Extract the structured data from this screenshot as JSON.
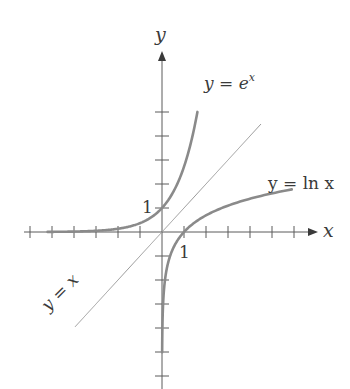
{
  "chart_data": {
    "type": "line",
    "title": "",
    "xlabel": "x",
    "ylabel": "y",
    "grid": false,
    "legend": "none (inline curve labels)",
    "origin_px": [
      162,
      232
    ],
    "scale_px_per_unit": {
      "x": 22,
      "y": 24
    },
    "x_ticks": [
      -6,
      -5,
      -4,
      -3,
      -2,
      -1,
      1,
      2,
      3,
      4,
      5,
      6
    ],
    "y_ticks": [
      -6,
      -5,
      -4,
      -3,
      -2,
      -1,
      1,
      2,
      3,
      4,
      5
    ],
    "tick_labels": {
      "x": [
        "1"
      ],
      "y": [
        "1"
      ]
    },
    "xlim": [
      -6.3,
      7.0
    ],
    "ylim": [
      -6.5,
      7.5
    ],
    "series": [
      {
        "name": "y = e^x",
        "function": "exp",
        "x_range": [
          -5.2,
          1.61
        ],
        "color": "#8a8a8a"
      },
      {
        "name": "y = ln x",
        "function": "ln",
        "x_range": [
          0.0067,
          5.9
        ],
        "color": "#8a8a8a"
      },
      {
        "name": "y = x",
        "function": "identity",
        "x_range": [
          -3.95,
          4.5
        ],
        "color": "#9a9a9a"
      }
    ],
    "annotations": [
      {
        "text": "y = e^x",
        "near": "end of exponential curve"
      },
      {
        "text": "y = ln x",
        "near": "end of logarithm curve"
      },
      {
        "text": "y = x",
        "near": "lower-left of identity line, rotated 45°"
      },
      {
        "text": "1",
        "near": "y-axis at y=1"
      },
      {
        "text": "1",
        "near": "x-axis at x=1"
      }
    ]
  },
  "labels": {
    "x_axis": "x",
    "y_axis": "y",
    "exp_prefix": "y = e",
    "exp_sup": "x",
    "ln_label": "y = ln x",
    "identity_label": "y = x",
    "x_tick_one": "1",
    "y_tick_one": "1"
  }
}
